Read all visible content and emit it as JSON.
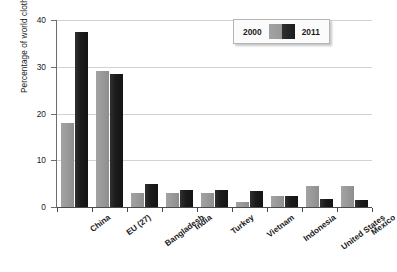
{
  "chart_data": {
    "type": "bar",
    "title": "",
    "subtitle": "",
    "xlabel": "",
    "ylabel": "Percentage of world clothing exports",
    "ylim": [
      0,
      40
    ],
    "yticks": [
      0,
      10,
      20,
      30,
      40
    ],
    "ytick_labels": [
      "0",
      "10",
      "20",
      "30",
      "40"
    ],
    "grid": true,
    "grid_axis": "y",
    "legend_position": "top-right",
    "categories": [
      "China",
      "EU (27)",
      "Bangladesh",
      "India",
      "Turkey",
      "Vietnam",
      "Indonesia",
      "United States",
      "Mexico"
    ],
    "series": [
      {
        "name": "2000",
        "color": "#989898",
        "values": [
          18.0,
          29.0,
          3.1,
          3.1,
          3.1,
          1.1,
          2.3,
          4.4,
          4.4
        ]
      },
      {
        "name": "2011",
        "color": "#1b1b1b",
        "values": [
          37.5,
          28.4,
          5.0,
          3.7,
          3.7,
          3.5,
          2.4,
          1.7,
          1.5
        ]
      }
    ]
  },
  "legend": {
    "left_label": "2000",
    "right_label": "2011"
  }
}
